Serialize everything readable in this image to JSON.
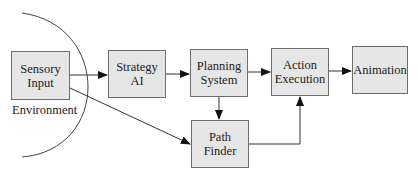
{
  "diagram": {
    "type": "flowchart",
    "region_label": "Environment",
    "nodes": [
      {
        "id": "sensory",
        "label": "Sensory\nInput"
      },
      {
        "id": "strategy",
        "label": "Strategy\nAI"
      },
      {
        "id": "planning",
        "label": "Planning\nSystem"
      },
      {
        "id": "action",
        "label": "Action\nExecution"
      },
      {
        "id": "animation",
        "label": "Animation"
      },
      {
        "id": "pathfinder",
        "label": "Path\nFinder"
      }
    ],
    "edges": [
      {
        "from": "sensory",
        "to": "strategy"
      },
      {
        "from": "sensory",
        "to": "pathfinder"
      },
      {
        "from": "strategy",
        "to": "planning"
      },
      {
        "from": "planning",
        "to": "action"
      },
      {
        "from": "planning",
        "to": "pathfinder"
      },
      {
        "from": "pathfinder",
        "to": "action"
      },
      {
        "from": "action",
        "to": "animation"
      }
    ],
    "colors": {
      "box_fill": "#e6e6e6",
      "box_border": "#6e6e6e",
      "line": "#333333"
    }
  }
}
